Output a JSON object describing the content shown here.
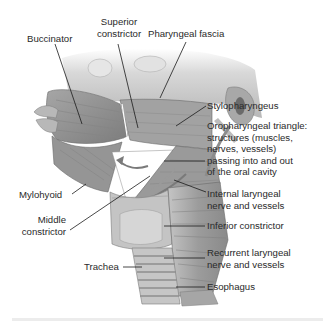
{
  "figure": {
    "colors": {
      "muscle": "#9a9a9a",
      "muscle_dark": "#6e6e6e",
      "bone": "#d4d4d4",
      "cartilage": "#bdbdbd",
      "leader_line": "#1a1a1a",
      "text": "#2a2a2a",
      "background": "#ffffff"
    }
  },
  "labels": {
    "buccinator": "Buccinator",
    "superior_constrictor_1": "Superior",
    "superior_constrictor_2": "constrictor",
    "pharyngeal_fascia": "Pharyngeal fascia",
    "stylopharyngeus": "Stylopharyngeus",
    "oropharyngeal_1": "Oropharyngeal triangle:",
    "oropharyngeal_2": "structures (muscles,",
    "oropharyngeal_3": "nerves, vessels)",
    "oropharyngeal_4": "passing into and out",
    "oropharyngeal_5": "of the oral cavity",
    "mylohyoid": "Mylohyoid",
    "middle_constrictor_1": "Middle",
    "middle_constrictor_2": "constrictor",
    "internal_laryngeal_1": "Internal laryngeal",
    "internal_laryngeal_2": "nerve and vessels",
    "inferior_constrictor": "Inferior constrictor",
    "recurrent_laryngeal_1": "Recurrent laryngeal",
    "recurrent_laryngeal_2": "nerve and vessels",
    "trachea": "Trachea",
    "esophagus": "Esophagus"
  }
}
